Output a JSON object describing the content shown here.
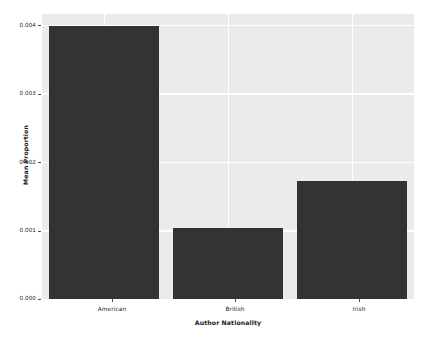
{
  "chart_data": {
    "type": "bar",
    "title": "",
    "subtitle": "",
    "xlabel": "Author Nationality",
    "ylabel": "Mean Proportion",
    "categories": [
      "American",
      "British",
      "Irish"
    ],
    "values": [
      0.00399,
      0.00103,
      0.00172
    ],
    "series": [
      {
        "name": "Mean Proportion",
        "values": [
          0.00399,
          0.00103,
          0.00172
        ]
      }
    ],
    "ylim": [
      0.0,
      0.00416
    ],
    "xlim": [
      0,
      3
    ],
    "yticks": [
      0.0,
      0.001,
      0.002,
      0.003,
      0.004
    ],
    "ytick_labels": [
      "0.000",
      "0.001",
      "0.002",
      "0.003",
      "0.004"
    ],
    "xtick_labels": [
      "American",
      "British",
      "Irish"
    ],
    "grid": true,
    "grid_color": "#ffffff",
    "legend": false,
    "legend_position": "none",
    "bar_color": "#333335",
    "panel_background": "#ebebeb",
    "figure_background": "#ffffff",
    "tick_color": "#4d4d4d",
    "text_color": "#262626"
  }
}
